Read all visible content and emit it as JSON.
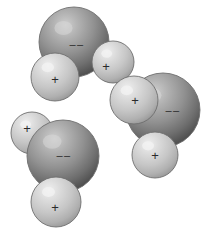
{
  "figure": {
    "background_color": "#ffffff",
    "width": 212,
    "height": 233
  },
  "legend": {
    "negative_symbol": "––",
    "positive_symbol": "+",
    "oxygen_color_light": "#c9c9c9",
    "oxygen_color_mid": "#8f8f8f",
    "oxygen_color_dark": "#4f4f4f",
    "hydrogen_color_light": "#eaeaea",
    "hydrogen_color_mid": "#cfcfcf",
    "hydrogen_color_dark": "#9a9a9a",
    "outline_color": "#6e6e6e"
  },
  "molecules": [
    {
      "name": "water-molecule-top-left",
      "oxygen": {
        "name": "oxygen-atom",
        "cx": 74,
        "cy": 42,
        "r": 35,
        "charge": "––",
        "charge_x": 77,
        "charge_y": 44,
        "charge_size": 11
      },
      "hydrogens": [
        {
          "name": "hydrogen-atom-lower-left",
          "cx": 55,
          "cy": 77,
          "r": 24,
          "charge": "+",
          "charge_x": 55,
          "charge_y": 79,
          "charge_size": 13
        },
        {
          "name": "hydrogen-atom-right",
          "cx": 113,
          "cy": 62,
          "r": 21,
          "charge": "+",
          "charge_x": 106,
          "charge_y": 66,
          "charge_size": 13
        }
      ]
    },
    {
      "name": "water-molecule-right",
      "oxygen": {
        "name": "oxygen-atom",
        "cx": 163,
        "cy": 110,
        "r": 37,
        "charge": "––",
        "charge_x": 173,
        "charge_y": 110,
        "charge_size": 11
      },
      "hydrogens": [
        {
          "name": "hydrogen-atom-upper-left",
          "cx": 134,
          "cy": 100,
          "r": 24,
          "charge": "+",
          "charge_x": 135,
          "charge_y": 100,
          "charge_size": 13
        },
        {
          "name": "hydrogen-atom-lower",
          "cx": 155,
          "cy": 155,
          "r": 23,
          "charge": "+",
          "charge_x": 155,
          "charge_y": 155,
          "charge_size": 13
        }
      ]
    },
    {
      "name": "water-molecule-bottom-left",
      "oxygen": {
        "name": "oxygen-atom",
        "cx": 63,
        "cy": 156,
        "r": 36,
        "charge": "––",
        "charge_x": 64,
        "charge_y": 155,
        "charge_size": 11
      },
      "hydrogens": [
        {
          "name": "hydrogen-atom-upper-left",
          "cx": 32,
          "cy": 133,
          "r": 21,
          "charge": "+",
          "charge_x": 27,
          "charge_y": 128,
          "charge_size": 13
        },
        {
          "name": "hydrogen-atom-bottom",
          "cx": 56,
          "cy": 202,
          "r": 25,
          "charge": "+",
          "charge_x": 55,
          "charge_y": 207,
          "charge_size": 13
        }
      ]
    }
  ]
}
